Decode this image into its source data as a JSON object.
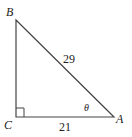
{
  "diagram": {
    "type": "right-triangle",
    "vertices": {
      "A": "A",
      "B": "B",
      "C": "C"
    },
    "right_angle_at": "C",
    "hypotenuse_label": "29",
    "base_label": "21",
    "angle_label": "θ",
    "line_color": "#444444"
  }
}
